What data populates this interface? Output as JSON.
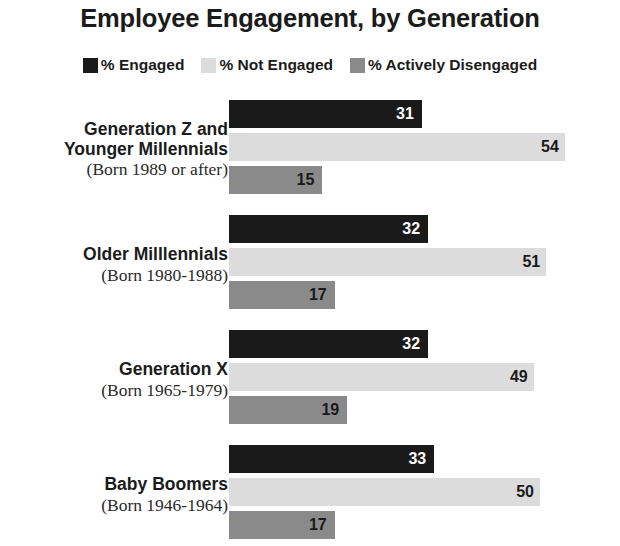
{
  "title": "Employee Engagement, by Generation",
  "legend": {
    "items": [
      {
        "label": "% Engaged",
        "color": "#1a1a1a"
      },
      {
        "label": "% Not Engaged",
        "color": "#dcdcdc"
      },
      {
        "label": "% Actively Disengaged",
        "color": "#8a8a8a"
      }
    ]
  },
  "groups": [
    {
      "name_line1": "Generation Z and",
      "name_line2": "Younger Millennials",
      "born": "(Born 1989 or after)",
      "values": {
        "engaged": "31",
        "not_engaged": "54",
        "actively_disengaged": "15"
      }
    },
    {
      "name_line1": "Older Milllennials",
      "name_line2": "",
      "born": "(Born 1980-1988)",
      "values": {
        "engaged": "32",
        "not_engaged": "51",
        "actively_disengaged": "17"
      }
    },
    {
      "name_line1": "Generation X",
      "name_line2": "",
      "born": "(Born 1965-1979)",
      "values": {
        "engaged": "32",
        "not_engaged": "49",
        "actively_disengaged": "19"
      }
    },
    {
      "name_line1": "Baby Boomers",
      "name_line2": "",
      "born": "(Born 1946-1964)",
      "values": {
        "engaged": "33",
        "not_engaged": "50",
        "actively_disengaged": "17"
      }
    }
  ],
  "chart_data": {
    "type": "bar",
    "title": "Employee Engagement, by Generation",
    "orientation": "horizontal",
    "grouped": true,
    "xlabel": "",
    "ylabel": "",
    "xlim": [
      0,
      60
    ],
    "grid": false,
    "legend_position": "top-center",
    "categories": [
      "Generation Z and Younger Millennials (Born 1989 or after)",
      "Older Milllennials (Born 1980-1988)",
      "Generation X (Born 1965-1979)",
      "Baby Boomers (Born 1946-1964)"
    ],
    "series": [
      {
        "name": "% Engaged",
        "color": "#1a1a1a",
        "values": [
          31,
          32,
          32,
          33
        ]
      },
      {
        "name": "% Not Engaged",
        "color": "#dcdcdc",
        "values": [
          54,
          51,
          49,
          50
        ]
      },
      {
        "name": "% Actively Disengaged",
        "color": "#8a8a8a",
        "values": [
          15,
          17,
          19,
          17
        ]
      }
    ],
    "units": "percent"
  }
}
